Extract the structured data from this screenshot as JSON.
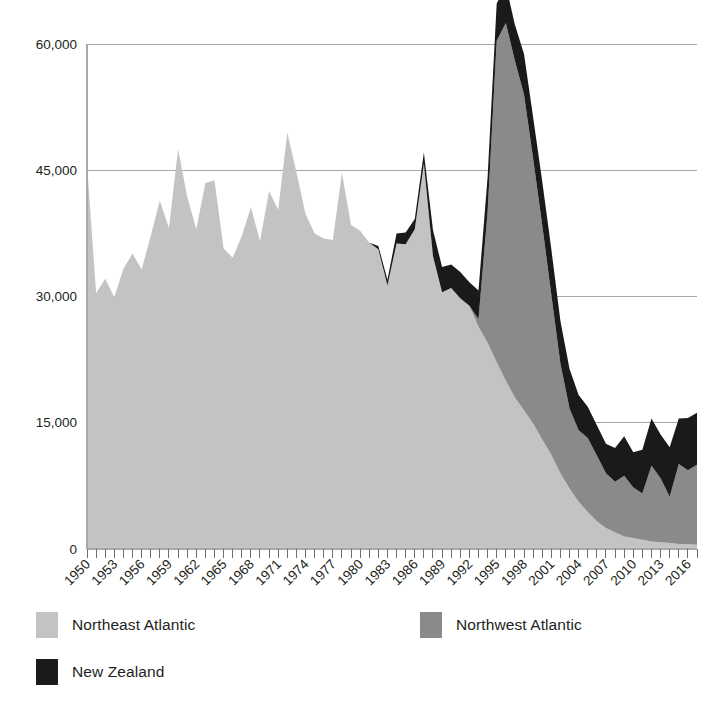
{
  "chart_data": {
    "type": "area",
    "stacked": true,
    "title": "",
    "xlabel": "",
    "ylabel": "",
    "ylim": [
      0,
      60000
    ],
    "yticks": [
      0,
      15000,
      30000,
      45000,
      60000
    ],
    "ytick_labels": [
      "0",
      "15,000",
      "30,000",
      "45,000",
      "60,000"
    ],
    "grid": true,
    "legend_position": "bottom",
    "x": [
      1950,
      1951,
      1952,
      1953,
      1954,
      1955,
      1956,
      1957,
      1958,
      1959,
      1960,
      1961,
      1962,
      1963,
      1964,
      1965,
      1966,
      1967,
      1968,
      1969,
      1970,
      1971,
      1972,
      1973,
      1974,
      1975,
      1976,
      1977,
      1978,
      1979,
      1980,
      1981,
      1982,
      1983,
      1984,
      1985,
      1986,
      1987,
      1988,
      1989,
      1990,
      1991,
      1992,
      1993,
      1994,
      1995,
      1996,
      1997,
      1998,
      1999,
      2000,
      2001,
      2002,
      2003,
      2004,
      2005,
      2006,
      2007,
      2008,
      2009,
      2010,
      2011,
      2012,
      2013,
      2014,
      2015,
      2016,
      2017
    ],
    "xtick_labels": [
      "1950",
      "1953",
      "1956",
      "1959",
      "1962",
      "1965",
      "1968",
      "1971",
      "1974",
      "1977",
      "1980",
      "1983",
      "1986",
      "1989",
      "1992",
      "1995",
      "1998",
      "2001",
      "2004",
      "2007",
      "2010",
      "2013",
      "2016"
    ],
    "xtick_step": 3,
    "series": [
      {
        "name": "Northeast Atlantic",
        "color": "#c3c3c3",
        "values": [
          45700,
          30400,
          32100,
          29900,
          33300,
          35100,
          33200,
          37200,
          41400,
          38100,
          47500,
          41900,
          38000,
          43500,
          43800,
          35700,
          34600,
          37200,
          40600,
          36600,
          42500,
          40300,
          49500,
          44800,
          39800,
          37500,
          36900,
          36700,
          44700,
          38500,
          37800,
          36400,
          35600,
          31300,
          36300,
          36200,
          38000,
          45800,
          34800,
          30500,
          31000,
          29800,
          28900,
          26400,
          24500,
          22200,
          20000,
          18000,
          16500,
          14900,
          13000,
          11200,
          9000,
          7200,
          5600,
          4400,
          3300,
          2500,
          2000,
          1500,
          1300,
          1100,
          900,
          800,
          700,
          600,
          550,
          500
        ]
      },
      {
        "name": "Northwest Atlantic",
        "color": "#8a8a8a",
        "values": [
          0,
          0,
          0,
          0,
          0,
          0,
          0,
          0,
          0,
          0,
          0,
          0,
          0,
          0,
          0,
          0,
          0,
          0,
          0,
          0,
          0,
          0,
          0,
          0,
          0,
          0,
          0,
          0,
          0,
          0,
          0,
          0,
          0,
          0,
          0,
          0,
          0,
          0,
          0,
          0,
          0,
          0,
          0,
          900,
          15500,
          38200,
          42500,
          40000,
          37500,
          31500,
          25500,
          19000,
          13000,
          9500,
          8500,
          8800,
          7800,
          6500,
          6000,
          7200,
          6000,
          5500,
          9000,
          7600,
          5500,
          9500,
          8800,
          9500
        ]
      },
      {
        "name": "New Zealand",
        "color": "#1a1a1a",
        "values": [
          0,
          0,
          0,
          0,
          0,
          0,
          0,
          0,
          0,
          0,
          0,
          0,
          0,
          0,
          0,
          0,
          0,
          0,
          0,
          0,
          0,
          0,
          0,
          0,
          0,
          0,
          0,
          0,
          0,
          0,
          0,
          0,
          400,
          700,
          1200,
          1400,
          1200,
          1300,
          3100,
          3000,
          2800,
          3100,
          2800,
          3400,
          4200,
          4400,
          4500,
          4300,
          4800,
          4900,
          5200,
          5400,
          5100,
          4700,
          4200,
          3700,
          3600,
          3500,
          4000,
          4700,
          4200,
          5200,
          5600,
          5200,
          5900,
          5400,
          6200,
          6200
        ]
      }
    ],
    "legend": [
      {
        "label": "Northeast Atlantic",
        "color": "#c3c3c3"
      },
      {
        "label": "Northwest Atlantic",
        "color": "#8a8a8a"
      },
      {
        "label": "New Zealand",
        "color": "#1a1a1a"
      }
    ]
  }
}
